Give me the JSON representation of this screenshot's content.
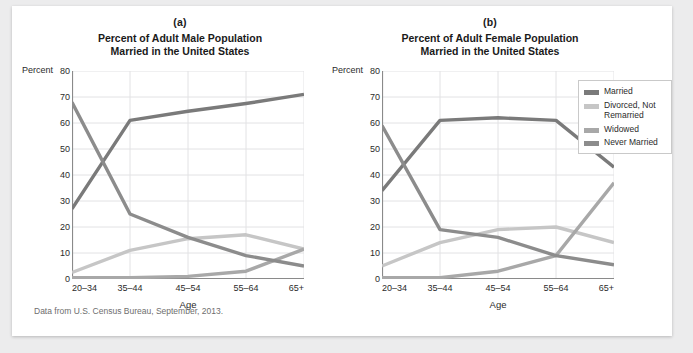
{
  "caption": "Data from U.S. Census Bureau, September, 2013.",
  "legend": {
    "items": [
      {
        "label": "Married",
        "color": "#7a7a7a"
      },
      {
        "label": "Divorced, Not Remarried",
        "color": "#c6c6c6"
      },
      {
        "label": "Widowed",
        "color": "#a8a8a8"
      },
      {
        "label": "Never Married",
        "color": "#8c8c8c"
      }
    ]
  },
  "chart_data": [
    {
      "type": "line",
      "panel": "(a)",
      "title": "Percent of Adult Male Population\nMarried in the United States",
      "title_line1": "Percent of Adult Male Population",
      "title_line2": "Married in the United States",
      "xlabel": "Age",
      "ylabel": "Percent",
      "categories": [
        "20–34",
        "35–44",
        "45–54",
        "55–64",
        "65+"
      ],
      "yticks": [
        0,
        10,
        20,
        30,
        40,
        50,
        60,
        70,
        80
      ],
      "ylim": [
        0,
        80
      ],
      "grid": true,
      "legend_position": "right-outside",
      "series": [
        {
          "name": "Married",
          "color": "#7a7a7a",
          "values": [
            27,
            61,
            64.5,
            67.5,
            71
          ]
        },
        {
          "name": "Divorced, Not Remarried",
          "color": "#c6c6c6",
          "values": [
            2.5,
            11,
            15.5,
            17,
            11.5
          ]
        },
        {
          "name": "Widowed",
          "color": "#a8a8a8",
          "values": [
            0.5,
            0.5,
            1,
            3,
            11.5
          ]
        },
        {
          "name": "Never Married",
          "color": "#8c8c8c",
          "values": [
            68,
            25,
            16,
            9,
            5
          ]
        }
      ]
    },
    {
      "type": "line",
      "panel": "(b)",
      "title": "Percent of Adult Female Population\nMarried in the United States",
      "title_line1": "Percent of Adult Female Population",
      "title_line2": "Married in the United States",
      "xlabel": "Age",
      "ylabel": "Percent",
      "categories": [
        "20–34",
        "35–44",
        "45–54",
        "55–64",
        "65+"
      ],
      "yticks": [
        0,
        10,
        20,
        30,
        40,
        50,
        60,
        70,
        80
      ],
      "ylim": [
        0,
        80
      ],
      "grid": true,
      "legend_position": "right-outside",
      "series": [
        {
          "name": "Married",
          "color": "#7a7a7a",
          "values": [
            34,
            61,
            62,
            61,
            43
          ]
        },
        {
          "name": "Divorced, Not Remarried",
          "color": "#c6c6c6",
          "values": [
            5,
            14,
            19,
            20,
            14
          ]
        },
        {
          "name": "Widowed",
          "color": "#a8a8a8",
          "values": [
            0.5,
            0.5,
            3,
            9,
            37
          ]
        },
        {
          "name": "Never Married",
          "color": "#8c8c8c",
          "values": [
            59,
            19,
            16,
            9,
            5.5
          ]
        }
      ]
    }
  ]
}
